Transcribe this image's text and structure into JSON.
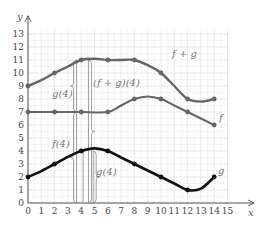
{
  "chart_data": {
    "type": "line",
    "title": "",
    "xlabel": "x",
    "ylabel": "y",
    "xlim": [
      0,
      15
    ],
    "ylim": [
      0,
      13
    ],
    "grid": true,
    "x_ticks": [
      "0",
      "1",
      "2",
      "3",
      "4",
      "5",
      "6",
      "7",
      "8",
      "9",
      "10",
      "11",
      "12",
      "13",
      "14",
      "15"
    ],
    "y_ticks": [
      "0",
      "1",
      "2",
      "3",
      "4",
      "5",
      "6",
      "7",
      "8",
      "9",
      "10",
      "11",
      "12",
      "13"
    ],
    "series": [
      {
        "name": "f + g",
        "color": "#666666",
        "width": 2.4,
        "points": [
          [
            0,
            9
          ],
          [
            1,
            9.45
          ],
          [
            2,
            10
          ],
          [
            3,
            10.5
          ],
          [
            4,
            11
          ],
          [
            5,
            11.1
          ],
          [
            6,
            11
          ],
          [
            7,
            11
          ],
          [
            8,
            11
          ],
          [
            9,
            10.6
          ],
          [
            10,
            10
          ],
          [
            11,
            9
          ],
          [
            12,
            8
          ],
          [
            13,
            7.8
          ],
          [
            14,
            8
          ]
        ],
        "markers": [
          [
            0,
            9
          ],
          [
            2,
            10
          ],
          [
            4,
            11
          ],
          [
            6,
            11
          ],
          [
            8,
            11
          ],
          [
            10,
            10
          ],
          [
            12,
            8
          ],
          [
            14,
            8
          ]
        ]
      },
      {
        "name": "f",
        "color": "#666666",
        "width": 2.0,
        "points": [
          [
            0,
            7
          ],
          [
            2,
            7
          ],
          [
            4,
            7
          ],
          [
            6,
            7
          ],
          [
            7,
            7.5
          ],
          [
            8,
            8
          ],
          [
            9,
            8.2
          ],
          [
            10,
            8
          ],
          [
            11,
            7.5
          ],
          [
            12,
            7
          ],
          [
            13,
            6.5
          ],
          [
            14,
            6
          ]
        ],
        "markers": [
          [
            0,
            7
          ],
          [
            2,
            7
          ],
          [
            4,
            7
          ],
          [
            6,
            7
          ],
          [
            8,
            8
          ],
          [
            10,
            8
          ],
          [
            12,
            7
          ],
          [
            14,
            6
          ]
        ]
      },
      {
        "name": "g",
        "color": "#111111",
        "width": 2.6,
        "points": [
          [
            0,
            2
          ],
          [
            1,
            2.45
          ],
          [
            2,
            3
          ],
          [
            3,
            3.55
          ],
          [
            4,
            4
          ],
          [
            5,
            4.2
          ],
          [
            6,
            4
          ],
          [
            7,
            3.5
          ],
          [
            8,
            3
          ],
          [
            9,
            2.5
          ],
          [
            10,
            2
          ],
          [
            11,
            1.5
          ],
          [
            12,
            1
          ],
          [
            13,
            1.1
          ],
          [
            14,
            2
          ]
        ],
        "markers": [
          [
            0,
            2
          ],
          [
            2,
            3
          ],
          [
            4,
            4
          ],
          [
            6,
            4
          ],
          [
            8,
            3
          ],
          [
            10,
            2
          ],
          [
            12,
            1
          ],
          [
            14,
            2
          ]
        ]
      }
    ],
    "annotations": [
      {
        "text": "g(4)",
        "note": "brace spanning y=7 to y=11 at x≈3.7"
      },
      {
        "text": "(f + g)(4)",
        "note": "brace spanning y=0 to y=11 at x≈4.6"
      },
      {
        "text": "f(4)",
        "note": "brace spanning y=0 to y=7 at x≈3.7"
      },
      {
        "text": "g(4)",
        "note": "brace spanning y=0 to y=4 at x≈4.9"
      }
    ],
    "series_labels": [
      "f + g",
      "f",
      "g"
    ]
  },
  "labels": {
    "fg": "f + g",
    "f": "f",
    "g": "g",
    "g4_upper": "g(4)",
    "fg4": "(f + g)(4)",
    "f4": "f(4)",
    "g4_lower": "g(4)",
    "x_axis": "x",
    "y_axis": "y"
  }
}
